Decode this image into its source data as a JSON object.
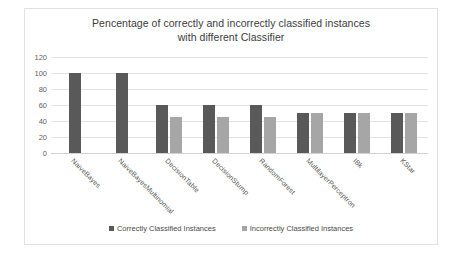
{
  "chart_data": {
    "type": "bar",
    "title": "Pencentage of correctly and incorrectly classified instances with different Classifier",
    "title_line1": "Pencentage of correctly and incorrectly classified instances",
    "title_line2": "with different Classifier",
    "xlabel": "",
    "ylabel": "",
    "ylim": [
      0,
      120
    ],
    "yticks": [
      120,
      100,
      80,
      60,
      40,
      20,
      0
    ],
    "grid": true,
    "legend_position": "bottom",
    "categories": [
      "NaiveBayes",
      "NaiveBayesMultinomial",
      "DecisionTable",
      "DecisionStump",
      "RandomForest",
      "MultilayerPerceptron",
      "IBk",
      "KStar"
    ],
    "series": [
      {
        "name": "Correctly Classified Instances",
        "color": "#595959",
        "values": [
          100,
          100,
          60,
          60,
          60,
          50,
          50,
          50
        ]
      },
      {
        "name": "Incorrectly Classified Instances",
        "color": "#a6a6a6",
        "values": [
          0,
          0,
          45,
          45,
          45,
          50,
          50,
          50
        ]
      }
    ]
  },
  "colors": {
    "correct": "#595959",
    "incorrect": "#a6a6a6",
    "gridline": "#e4e4e4",
    "frame_border": "#e2e2e2",
    "title_text": "#3c3c3c",
    "tick_text": "#5f5f5f"
  }
}
